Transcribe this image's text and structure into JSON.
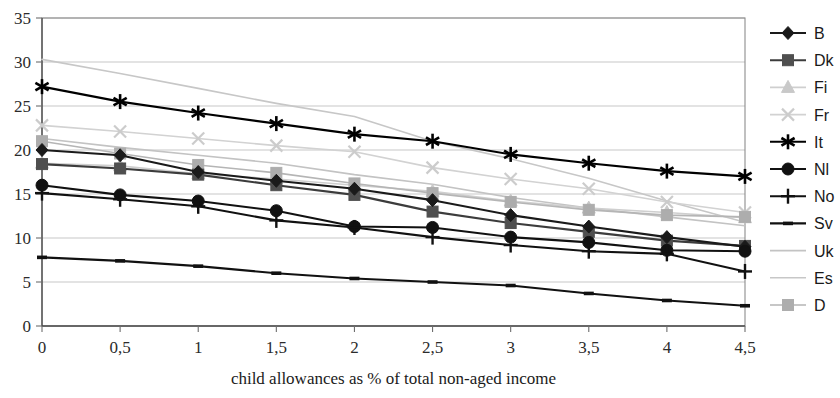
{
  "chart_data": {
    "type": "line",
    "title": "",
    "xlabel": "child allowances as % of total non-aged income",
    "ylabel": "",
    "x": [
      0,
      0.5,
      1,
      1.5,
      2,
      2.5,
      3,
      3.5,
      4,
      4.5
    ],
    "x_tick_labels": [
      "0",
      "0,5",
      "1",
      "1,5",
      "2",
      "2,5",
      "3",
      "3,5",
      "4",
      "4,5"
    ],
    "y_tick_labels": [
      "0",
      "5",
      "10",
      "15",
      "20",
      "25",
      "30",
      "35"
    ],
    "y_ticks": [
      0,
      5,
      10,
      15,
      20,
      25,
      30,
      35
    ],
    "ylim": [
      0,
      35
    ],
    "xlim": [
      0,
      4.5
    ],
    "grid": "horizontal",
    "legend_position": "right",
    "series": [
      {
        "name": "B",
        "marker": "diamond",
        "color": "#1a1a1a",
        "line_color": "#1a1a1a",
        "values": [
          20.0,
          19.4,
          17.5,
          16.5,
          15.6,
          14.3,
          12.6,
          11.3,
          10.1,
          9.0
        ]
      },
      {
        "name": "Dk",
        "marker": "square",
        "color": "#4f4f4f",
        "line_color": "#3c3c3c",
        "values": [
          18.4,
          17.9,
          17.2,
          16.0,
          14.9,
          13.0,
          11.7,
          10.7,
          9.7,
          9.1
        ]
      },
      {
        "name": "Fi",
        "marker": "triangle",
        "color": "#c9c9c9",
        "line_color": "#cfcfcf",
        "values": [
          18.5,
          18.2,
          17.3,
          16.7,
          16.0,
          15.3,
          14.2,
          13.4,
          12.9,
          12.3
        ]
      },
      {
        "name": "Fr",
        "marker": "cross-x",
        "color": "#cccccc",
        "line_color": "#d2d2d2",
        "values": [
          22.8,
          22.1,
          21.3,
          20.5,
          19.8,
          18.0,
          16.7,
          15.6,
          14.1,
          12.9
        ]
      },
      {
        "name": "It",
        "marker": "asterisk",
        "color": "#000000",
        "line_color": "#000000",
        "values": [
          27.2,
          25.5,
          24.2,
          23.0,
          21.8,
          21.0,
          19.5,
          18.5,
          17.6,
          17.0
        ]
      },
      {
        "name": "Nl",
        "marker": "circle",
        "color": "#111111",
        "line_color": "#111111",
        "values": [
          16.0,
          14.9,
          14.2,
          13.1,
          11.3,
          11.2,
          10.1,
          9.5,
          8.6,
          8.5
        ]
      },
      {
        "name": "No",
        "marker": "plus",
        "color": "#111111",
        "line_color": "#111111",
        "values": [
          15.1,
          14.4,
          13.6,
          12.0,
          11.2,
          10.1,
          9.2,
          8.5,
          8.2,
          6.2
        ]
      },
      {
        "name": "Sv",
        "marker": "dash",
        "color": "#111111",
        "line_color": "#111111",
        "values": [
          7.8,
          7.4,
          6.8,
          6.0,
          5.4,
          5.0,
          4.6,
          3.7,
          2.9,
          2.3
        ]
      },
      {
        "name": "Uk",
        "marker": "line",
        "color": "#bdbdbd",
        "line_color": "#c3c3c3",
        "values": [
          21.3,
          20.3,
          19.4,
          18.5,
          17.2,
          16.1,
          14.6,
          13.4,
          12.4,
          11.4
        ]
      },
      {
        "name": "Es",
        "marker": "dotted",
        "color": "#c7c7c7",
        "line_color": "#c7c7c7",
        "values": [
          30.3,
          28.7,
          27.0,
          25.3,
          23.8,
          21.0,
          19.0,
          16.8,
          14.2,
          11.8
        ]
      },
      {
        "name": "D",
        "marker": "square-light",
        "color": "#adadad",
        "line_color": "#b5b5b5",
        "values": [
          21.0,
          19.6,
          18.3,
          17.4,
          16.2,
          15.1,
          14.1,
          13.2,
          12.6,
          12.4
        ]
      }
    ]
  }
}
